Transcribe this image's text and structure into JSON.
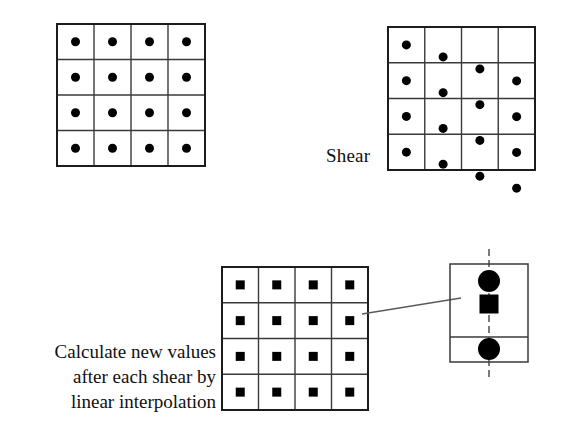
{
  "figure": {
    "background_color": "#ffffff",
    "ink_color": "#111111",
    "marker_color": "#000000",
    "grid_line_color": "#3a3a3a",
    "grid_border_color": "#1c1c1c",
    "leader_line_color": "#5a5a5a",
    "dashed_axis_color": "#444444"
  },
  "labels": {
    "shear": "Shear",
    "interpolation_lines": [
      "Calculate new values",
      "after each shear by",
      "linear interpolation"
    ]
  },
  "panels": {
    "original_grid": {
      "name": "original-sample-grid",
      "marker_shape": "circle",
      "rows": 4,
      "cols": 4,
      "x": 57,
      "y": 24,
      "width": 148,
      "height": 142,
      "shear_per_column": 0,
      "marker_size": 9
    },
    "sheared_grid": {
      "name": "sheared-sample-grid",
      "marker_shape": "circle",
      "rows": 4,
      "cols": 4,
      "x": 388,
      "y": 27,
      "width": 147,
      "height": 143,
      "shear_per_column": 12,
      "marker_size": 9
    },
    "resampled_grid": {
      "name": "resampled-value-grid",
      "marker_shape": "square",
      "rows": 4,
      "cols": 4,
      "x": 222,
      "y": 267,
      "width": 146,
      "height": 143,
      "shear_per_column": 0,
      "marker_size": 9
    },
    "detail_callout": {
      "name": "interpolation-detail-callout",
      "x": 450,
      "y": 264,
      "width": 78,
      "height": 98,
      "divider_y": 337,
      "axis_x": 489,
      "axis_top": 249,
      "axis_bottom": 377,
      "upper_circle": {
        "cx": 489,
        "cy": 281,
        "r": 11
      },
      "interpolated_square": {
        "cx": 489,
        "cy": 304,
        "size": 19
      },
      "lower_circle": {
        "cx": 489,
        "cy": 349,
        "r": 11
      }
    },
    "leader_line": {
      "name": "callout-leader-line",
      "x1": 362,
      "y1": 314,
      "x2": 461,
      "y2": 298
    }
  }
}
